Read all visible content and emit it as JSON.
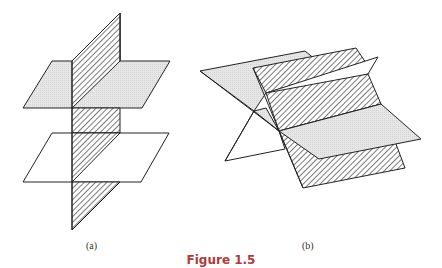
{
  "figure": {
    "caption": "Figure 1.5",
    "caption_color": "#b03a3a",
    "panels": [
      {
        "label": "(a)",
        "description": "Two parallel horizontal planes (upper shaded, lower white) intersected by a vertical hatched plane"
      },
      {
        "label": "(b)",
        "description": "Three planes (shaded, hatched, white) intersecting pairwise along parallel lines forming a prism-like arrangement"
      }
    ]
  },
  "colors": {
    "stroke": "#222222",
    "shade": "#e4e4e4",
    "hatch": "#333333",
    "background": "#ffffff"
  }
}
